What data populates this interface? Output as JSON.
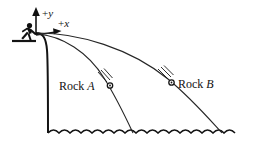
{
  "figure": {
    "axes": {
      "y_label": "+y",
      "y_label_sign": "+",
      "y_label_var": "y",
      "x_label": "+x",
      "x_label_sign": "+",
      "x_label_var": "x",
      "origin_x": 33,
      "origin_y": 35
    },
    "objects": [
      {
        "id": "rock-a",
        "label": "Rock A",
        "label_word": "Rock",
        "label_letter": "A",
        "label_x": 60,
        "label_y": 91,
        "marker_x": 110,
        "marker_y": 86
      },
      {
        "id": "rock-b",
        "label": "Rock B",
        "label_word": "Rock",
        "label_letter": "B",
        "label_x": 180,
        "label_y": 89,
        "marker_x": 172,
        "marker_y": 83
      }
    ],
    "elements": {
      "person": "thrower-silhouette",
      "cliff": "vertical-cliff-face",
      "water": "wavy-water-surface",
      "trajectory_a": "parabolic-path-rock-a",
      "trajectory_b": "parabolic-path-rock-b"
    },
    "colors": {
      "ink": "#141414",
      "trajectory": "#262626",
      "background": "#ffffff"
    }
  }
}
